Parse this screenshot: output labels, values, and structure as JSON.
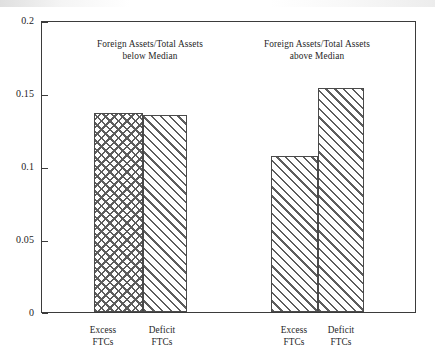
{
  "chart_data": {
    "type": "bar",
    "title": "",
    "subtitle": "",
    "xlabel": "",
    "ylabel": "",
    "ylim": [
      0,
      0.2
    ],
    "yticks": [
      "0",
      "0.05",
      "0.1",
      "0.15",
      "0.2"
    ],
    "ytick_values": [
      0,
      0.05,
      0.1,
      0.15,
      0.2
    ],
    "grid": false,
    "legend": "none",
    "panels": [
      {
        "caption_line1": "Foreign Assets/Total Assets",
        "caption_line2": "below Median",
        "categories": [
          "Excess\nFTCs",
          "Deficit\nFTCs"
        ],
        "bars": [
          {
            "label_line1": "Excess",
            "label_line2": "FTCs",
            "value": 0.137,
            "pattern": "cross-hatch"
          },
          {
            "label_line1": "Deficit",
            "label_line2": "FTCs",
            "value": 0.1355,
            "pattern": "diagonal-hatch"
          }
        ]
      },
      {
        "caption_line1": "Foreign Assets/Total Assets",
        "caption_line2": "above Median",
        "categories": [
          "Excess\nFTCs",
          "Deficit\nFTCs"
        ],
        "bars": [
          {
            "label_line1": "Excess",
            "label_line2": "FTCs",
            "value": 0.107,
            "pattern": "diagonal-hatch"
          },
          {
            "label_line1": "Deficit",
            "label_line2": "FTCs",
            "value": 0.1541,
            "pattern": "diagonal-hatch"
          }
        ]
      }
    ],
    "colors": {
      "axis": "#3b3b3b",
      "bar_outline": "#4a4a4a",
      "hatch": "#5d5d5d",
      "background": "#ffffff",
      "text": "#262626"
    }
  }
}
